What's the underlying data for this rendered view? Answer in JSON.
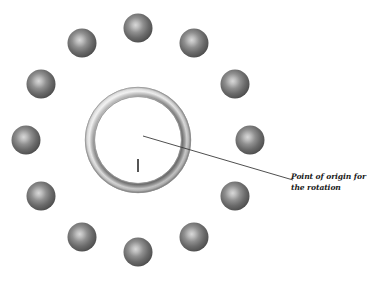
{
  "figure": {
    "name": "rotation-array-diagram",
    "background_color": "#ffffff",
    "width": 367,
    "height": 283,
    "top_cropped_text": "",
    "annotation": {
      "line1": "Point of origin for",
      "line2": "the rotation",
      "full_text": "Point of origin for the rotation",
      "color": "#1a1a1a",
      "style": "bold-italic-serif"
    },
    "leader_line": {
      "name": "leader-line",
      "from_x": 143,
      "from_y": 136,
      "to_x": 293,
      "to_y": 180,
      "color": "#3b3b3b",
      "width": 0.9
    },
    "center_mark": {
      "name": "center-tick-mark",
      "label": "I",
      "x": 138,
      "y": 160,
      "height": 13,
      "color": "#2b2b2b"
    },
    "ring": {
      "name": "torus-ring",
      "center_x": 138,
      "center_y": 140,
      "outer_radius": 53,
      "inner_radius": 43,
      "highlight_color": "#f2f2f2",
      "mid_color": "#bdbdbd",
      "shadow_color": "#8d8d8d",
      "edge_color": "#7a7a7a"
    },
    "spheres": {
      "name": "sphere-ring",
      "count": 12,
      "radius": 14.5,
      "orbit_radius": 112,
      "orbit_center_x": 138,
      "orbit_center_y": 140,
      "start_angle_deg": -90,
      "highlight_color": "#d6d6d6",
      "body_color": "#6e6e6e",
      "edge_color": "#4a4a4a",
      "positions": [
        {
          "index": 1,
          "x": 138,
          "y": 28,
          "angle_deg": -90
        },
        {
          "index": 2,
          "x": 194,
          "y": 43,
          "angle_deg": -60
        },
        {
          "index": 3,
          "x": 235,
          "y": 84,
          "angle_deg": -30
        },
        {
          "index": 4,
          "x": 250,
          "y": 140,
          "angle_deg": 0
        },
        {
          "index": 5,
          "x": 235,
          "y": 196,
          "angle_deg": 30
        },
        {
          "index": 6,
          "x": 194,
          "y": 237,
          "angle_deg": 60
        },
        {
          "index": 7,
          "x": 138,
          "y": 252,
          "angle_deg": 90
        },
        {
          "index": 8,
          "x": 82,
          "y": 237,
          "angle_deg": 120
        },
        {
          "index": 9,
          "x": 41,
          "y": 196,
          "angle_deg": 150
        },
        {
          "index": 10,
          "x": 26,
          "y": 140,
          "angle_deg": 180
        },
        {
          "index": 11,
          "x": 41,
          "y": 84,
          "angle_deg": 210
        },
        {
          "index": 12,
          "x": 82,
          "y": 43,
          "angle_deg": 240
        }
      ]
    }
  }
}
